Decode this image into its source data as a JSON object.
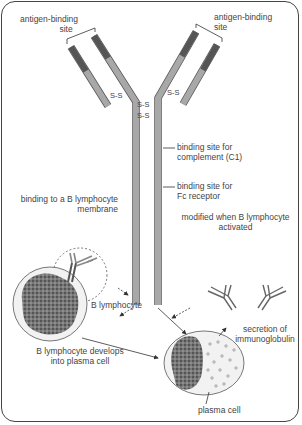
{
  "diagram": {
    "labels": {
      "antigen_site_left_1": "antigen-binding",
      "antigen_site_left_2": "site",
      "antigen_site_right_1": "antigen-binding",
      "antigen_site_right_2": "site",
      "disulfide": "S-S",
      "complement_1": "binding site for",
      "complement_2": "complement (C1)",
      "fc_1": "binding site for",
      "fc_2": "Fc receptor",
      "membrane_1": "binding to a B lymphocyte",
      "membrane_2": "membrane",
      "modified_1": "modified when B lymphocyte",
      "modified_2": "activated",
      "b_lymphocyte": "B lymphocyte",
      "develops_1": "B lymphocyte develops",
      "develops_2": "into plasma cell",
      "secretion_1": "secretion of",
      "secretion_2": "immunoglobulin",
      "plasma_cell": "plasma cell"
    },
    "colors": {
      "heavy_chain": "#9a9a9a",
      "variable_region": "#5a5a5a",
      "cytoplasm": "#f0f0f0",
      "nucleus": "#6a6a6a",
      "outline": "#444444"
    }
  }
}
